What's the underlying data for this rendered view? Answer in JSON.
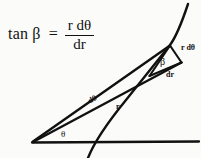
{
  "figure": {
    "type": "geometry-diagram",
    "background_color": "#fbfbfa",
    "ink_color": "#111111",
    "width": 201,
    "height": 158
  },
  "equation": {
    "lhs": "tan β",
    "equals": "=",
    "numerator": "r dθ",
    "denominator": "dr",
    "full_text": "tan β = r dθ / dr"
  },
  "labels": {
    "r_dtheta": "r dθ",
    "dr": "dr",
    "beta": "β",
    "dtheta": "dθ",
    "r": "r",
    "theta": "θ"
  },
  "geometry": {
    "origin": {
      "x": 32,
      "y": 142
    },
    "baseline": {
      "x1": 32,
      "y1": 142,
      "x2": 199,
      "y2": 141
    },
    "ray_outer": {
      "x1": 32,
      "y1": 142,
      "x2": 170,
      "y2": 45
    },
    "ray_inner": {
      "x1": 32,
      "y1": 142,
      "x2": 180,
      "y2": 62
    },
    "apex": {
      "x": 170,
      "y": 45
    },
    "small_triangle": [
      {
        "x": 170,
        "y": 45
      },
      {
        "x": 181,
        "y": 62
      },
      {
        "x": 150,
        "y": 76
      }
    ],
    "curve_description": "spiral arc rising left-to-right crossing the baseline near x=88 and passing through the apex"
  }
}
